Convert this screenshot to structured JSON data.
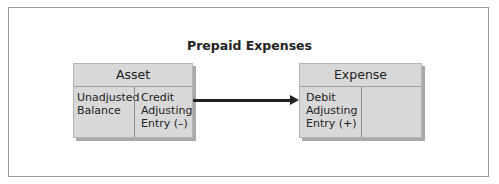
{
  "diagram": {
    "title": "Prepaid Expenses",
    "asset_account": {
      "header": "Asset",
      "left_column": [
        "Unadjusted",
        "Balance"
      ],
      "right_column": [
        "Credit",
        "Adjusting",
        "Entry (–)"
      ]
    },
    "expense_account": {
      "header": "Expense",
      "left_column": [
        "Debit",
        "Adjusting",
        "Entry (+)"
      ],
      "right_column": []
    },
    "arrow": {
      "from": "asset_account.right_column",
      "to": "expense_account.left_column"
    },
    "colors": {
      "box_fill": "#d8d8d8",
      "border": "#9a9a9a",
      "text": "#222222"
    }
  }
}
